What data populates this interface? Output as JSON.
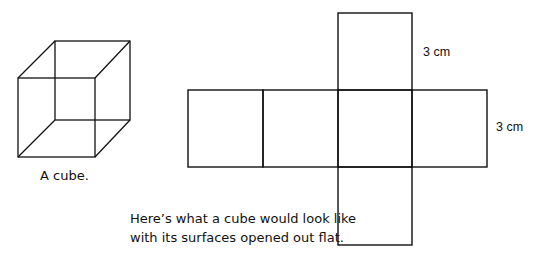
{
  "cube": {
    "caption": "A cube."
  },
  "net": {
    "caption_line1": "Here’s what a cube would look like",
    "caption_line2": "with its surfaces opened out flat.",
    "dimension_top": "3 cm",
    "dimension_right": "3 cm"
  },
  "colors": {
    "stroke": "#111111",
    "background": "#ffffff"
  }
}
